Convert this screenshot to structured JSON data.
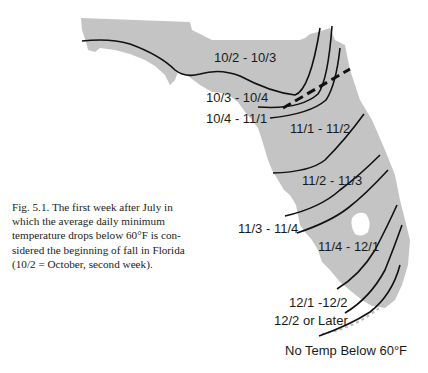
{
  "figure": {
    "caption": "Fig. 5.1. The first week after July in which the average daily minimum temperature drops below 60°F is considered the beginning of fall in Florida (10/2 = October, second week).",
    "caption_lines": [
      "Fig. 5.1. The first week after July in",
      "which the average daily minimum",
      "temperature drops below 60°F is con-",
      "sidered the beginning of fall in Florida",
      "(10/2 = October, second week)."
    ]
  },
  "map": {
    "region": "Florida",
    "land_color": "#c4c4c4",
    "line_color": "#111111",
    "zones": [
      {
        "label": "10/2 - 10/3"
      },
      {
        "label": "10/3 - 10/4"
      },
      {
        "label": "10/4 - 11/1"
      },
      {
        "label": "11/1 - 11/2"
      },
      {
        "label": "11/2 - 11/3"
      },
      {
        "label": "11/3 - 11/4"
      },
      {
        "label": "11/4 - 12/1"
      },
      {
        "label": "12/1 -12/2"
      },
      {
        "label": "12/2 or Later"
      },
      {
        "label": "No Temp Below 60°F"
      }
    ]
  }
}
